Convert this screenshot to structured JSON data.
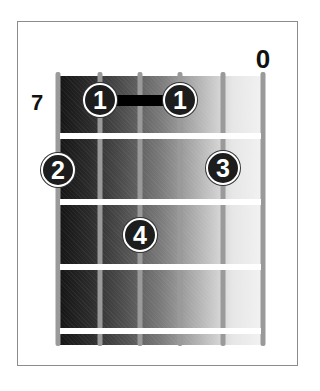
{
  "diagram": {
    "type": "guitar-chord-chart",
    "start_fret_label": "7",
    "string_count": 6,
    "fret_rows": 4,
    "open_strings": [
      {
        "string": 6,
        "label": "0"
      }
    ],
    "fingers": [
      {
        "finger": "1",
        "string": 2,
        "fret_row": 1
      },
      {
        "finger": "1",
        "string": 4,
        "fret_row": 1
      },
      {
        "finger": "2",
        "string": 1,
        "fret_row": 2
      },
      {
        "finger": "3",
        "string": 5,
        "fret_row": 2
      },
      {
        "finger": "4",
        "string": 3,
        "fret_row": 3
      }
    ],
    "barre": {
      "from_string": 2,
      "to_string": 4,
      "fret_row": 1
    },
    "colors": {
      "dark": "#141414",
      "light": "#f2f2f2",
      "string": "#9a9a9a",
      "fret": "#ffffff",
      "finger": "#1d1d1d"
    }
  }
}
